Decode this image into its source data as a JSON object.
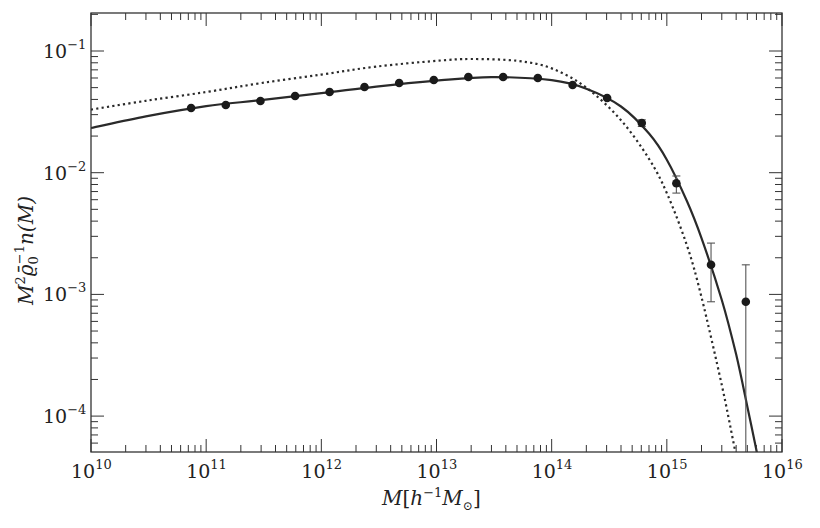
{
  "chart_data": {
    "type": "line",
    "title": "",
    "xlabel": "M[h^-1 M_sun]",
    "ylabel": "M^2 rho0^-1 n(M)",
    "xscale": "log",
    "yscale": "log",
    "xlim": [
      10000000000.0,
      1e+16
    ],
    "ylim": [
      5.06e-05,
      0.165
    ],
    "grid": false,
    "legend": null,
    "x_ticks": [
      {
        "exp": "10",
        "label": "10",
        "sup": "10"
      },
      {
        "exp": "11",
        "label": "10",
        "sup": "11"
      },
      {
        "exp": "12",
        "label": "10",
        "sup": "12"
      },
      {
        "exp": "13",
        "label": "10",
        "sup": "13"
      },
      {
        "exp": "14",
        "label": "10",
        "sup": "14"
      },
      {
        "exp": "15",
        "label": "10",
        "sup": "15"
      },
      {
        "exp": "16",
        "label": "10",
        "sup": "16"
      }
    ],
    "y_ticks": [
      {
        "exp": "-1",
        "label": "10",
        "sup": "−1"
      },
      {
        "exp": "-2",
        "label": "10",
        "sup": "−2"
      },
      {
        "exp": "-3",
        "label": "10",
        "sup": "−3"
      },
      {
        "exp": "-4",
        "label": "10",
        "sup": "−4"
      }
    ],
    "series": [
      {
        "name": "data points (with error bars)",
        "style": "scatter",
        "color": "#1a1a1a",
        "x": [
          74000000000.0,
          148000000000.0,
          296000000000.0,
          592000000000.0,
          1180000000000.0,
          2370000000000.0,
          4740000000000.0,
          9470000000000.0,
          18900000000000.0,
          37900000000000.0,
          75800000000000.0,
          152000000000000.0,
          303000000000000.0,
          606000000000000.0,
          1210000000000000.0,
          2420000000000000.0,
          4850000000000000.0
        ],
        "values": [
          0.034,
          0.036,
          0.0388,
          0.0427,
          0.0461,
          0.0506,
          0.0546,
          0.0578,
          0.0611,
          0.0611,
          0.06,
          0.0526,
          0.0411,
          0.0256,
          0.0082,
          0.00175,
          0.00087
        ],
        "err_low": [
          null,
          null,
          null,
          null,
          null,
          null,
          null,
          null,
          null,
          null,
          null,
          null,
          null,
          0.024,
          0.0068,
          0.00087,
          5.06e-05
        ],
        "err_high": [
          null,
          null,
          null,
          null,
          null,
          null,
          null,
          null,
          null,
          null,
          null,
          null,
          null,
          0.0272,
          0.0094,
          0.00264,
          0.00175
        ]
      },
      {
        "name": "solid model curve",
        "style": "solid",
        "color": "#2a2a2a",
        "x": [
          10000000000.0,
          30000000000.0,
          100000000000.0,
          300000000000.0,
          1000000000000.0,
          3000000000000.0,
          10000000000000.0,
          30000000000000.0,
          100000000000000.0,
          200000000000000.0,
          400000000000000.0,
          700000000000000.0,
          1000000000000000.0,
          1500000000000000.0,
          2000000000000000.0,
          3000000000000000.0,
          4000000000000000.0,
          5000000000000000.0,
          6200000000000000.0
        ],
        "values": [
          0.0233,
          0.029,
          0.0352,
          0.0395,
          0.045,
          0.051,
          0.057,
          0.061,
          0.0575,
          0.049,
          0.035,
          0.021,
          0.0128,
          0.0058,
          0.0029,
          0.0009,
          0.00032,
          0.00012,
          4.5e-05
        ]
      },
      {
        "name": "dotted model curve",
        "style": "dotted",
        "color": "#2a2a2a",
        "x": [
          10000000000.0,
          30000000000.0,
          100000000000.0,
          300000000000.0,
          1000000000000.0,
          3000000000000.0,
          10000000000000.0,
          20000000000000.0,
          50000000000000.0,
          100000000000000.0,
          200000000000000.0,
          400000000000000.0,
          700000000000000.0,
          1000000000000000.0,
          1500000000000000.0,
          2000000000000000.0,
          3000000000000000.0,
          3800000000000000.0,
          4400000000000000.0
        ],
        "values": [
          0.033,
          0.039,
          0.046,
          0.0545,
          0.064,
          0.0745,
          0.083,
          0.086,
          0.083,
          0.072,
          0.05,
          0.027,
          0.013,
          0.0068,
          0.0025,
          0.00095,
          0.00018,
          6e-05,
          3e-05
        ]
      }
    ]
  },
  "axes": {
    "x_title_main": "M",
    "x_title_bracket_open": "[",
    "x_title_h": "h",
    "x_title_h_sup": "−1",
    "x_title_m": "M",
    "x_title_sun": "⊙",
    "x_title_bracket_close": "]",
    "y_title_m": "M",
    "y_title_m_sup": "2",
    "y_title_rho": "ϱ̄",
    "y_title_rho_sub": "0",
    "y_title_rho_sup": "−1",
    "y_title_n": "n(M)"
  }
}
